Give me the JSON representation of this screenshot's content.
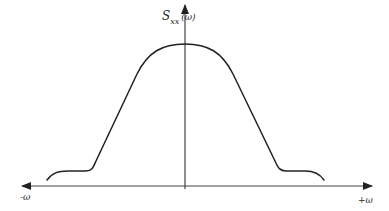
{
  "diagram": {
    "type": "power-spectral-density-sketch",
    "y_axis_label": {
      "symbol": "S",
      "subscript": "xx",
      "argument": "(ω)"
    },
    "x_axis_left_label": "-ω",
    "x_axis_right_label": "+ω",
    "colors": {
      "line": "#222222",
      "axis": "#444444",
      "background": "#ffffff"
    },
    "curve_description": "Symmetric bell-like curve centered on vertical axis, flat top, linear flanks, small low shoulders near the base that curl downward at the outer ends"
  }
}
